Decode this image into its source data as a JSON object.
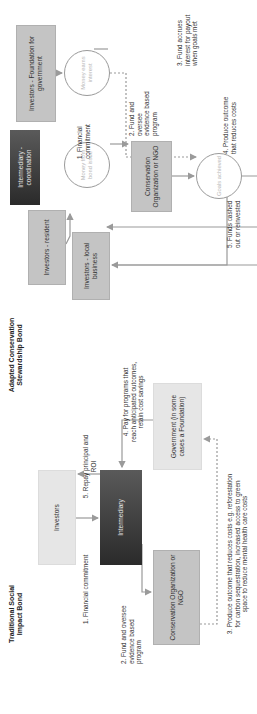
{
  "adapted": {
    "title": "Adapted Conservation\nStewardship Bond",
    "nodes": {
      "foundation": "Investors - Foundation for government",
      "money_earns": "Money earns interest",
      "intermediary": "Intermediary - coordination",
      "money_bond": "Money from bond issue",
      "conservation": "Conservation Organization or NGO",
      "goals": "Goals achieved",
      "resident": "Investors - resident",
      "local_business": "Investors - local business"
    },
    "steps": {
      "s1": "1. Financial\ncommitment",
      "s2": "2. Fund and\noversee\nevidence based\nprogram",
      "s3": "3. Fund accrues\ninterest for payout\nwhen goals met",
      "s4": "4. Produce outcome\nthat reduces costs",
      "s5": "5. Funds cashed\nout or reinvested"
    }
  },
  "traditional": {
    "title": "Traditional Social\nImpact Bond",
    "nodes": {
      "investors": "Investors",
      "intermediary": "Intermediary",
      "conservation": "Conservation Organization or NGO",
      "government": "Government (in some cases a Foundation)"
    },
    "steps": {
      "s1": "1. Financial commitment",
      "s2": "2. Fund and oversee\nevidence based\nprogram",
      "s3": "3. Produce outcome that reduces costs e.g. reforestation\nfor carbon sequestration, increased access to green\nspace to reduce mental health care costs",
      "s4": "4. Pay for programs that\nreach anticipated outcomes,\nretain cost savings",
      "s5": "5. Repay principal and\nROI"
    }
  },
  "colors": {
    "box_gray": "#c4c4c4",
    "box_light": "#e6e6e6",
    "box_dark": "#2a2a2a",
    "arrow": "#9a9a9a"
  }
}
